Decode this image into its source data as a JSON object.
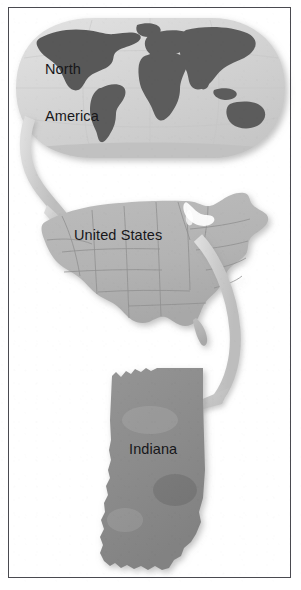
{
  "figure": {
    "kind": "geographic-nesting-diagram",
    "orientation": "vertical",
    "background_color": "#ffffff",
    "border_color": "#4a4a50",
    "levels": [
      {
        "order": 1,
        "name": "world-globe",
        "label": "North\nAmerica",
        "label_lines": [
          "North",
          "America"
        ],
        "shape": "oval world map projection",
        "highlighted_region": "North America",
        "ocean_color": "#d6d6d6",
        "land_color": "#8f8f8f",
        "continent_color": "#5c5c5c",
        "continents_shown": [
          "North America",
          "South America",
          "Africa",
          "Europe",
          "Asia",
          "Australia",
          "Antarctica"
        ]
      },
      {
        "order": 2,
        "name": "united-states-map",
        "label": "United States",
        "shape": "contiguous United States with state boundaries",
        "fill_color": "#b5b5b5",
        "outline_color": "#8e8e8e"
      },
      {
        "order": 3,
        "name": "indiana-map",
        "label": "Indiana",
        "shape": "State of Indiana silhouette",
        "fill_color": "#8c8c8c",
        "outline_color": "#7a7a7a"
      }
    ],
    "arrows": [
      {
        "name": "arrow-globe-to-united-states",
        "from": "North America",
        "to": "United States",
        "direction": "down-right curve",
        "color": "#c9c9c9"
      },
      {
        "name": "arrow-united-states-to-indiana",
        "from": "United States",
        "to": "Indiana",
        "direction": "down-left curve",
        "color": "#c9c9c9"
      }
    ]
  },
  "labels": {
    "north_america_line1": "North",
    "north_america_line2": "America",
    "united_states": "United States",
    "indiana": "Indiana"
  }
}
